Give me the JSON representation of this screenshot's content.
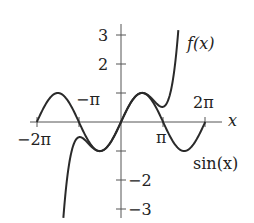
{
  "chart_data": {
    "type": "line",
    "title": "",
    "xlabel": "x",
    "ylabel": "",
    "xlim": [
      -6.7,
      7.6
    ],
    "ylim": [
      -3.4,
      3.5
    ],
    "grid": false,
    "legend": "inline labels",
    "x_ticks": [
      {
        "value": -6.2832,
        "label": "−2π"
      },
      {
        "value": -3.1416,
        "label": "−π"
      },
      {
        "value": 3.1416,
        "label": "π"
      },
      {
        "value": 6.2832,
        "label": "2π"
      }
    ],
    "y_ticks": [
      {
        "value": 3,
        "label": "3"
      },
      {
        "value": 2,
        "label": "2"
      },
      {
        "value": 1,
        "label": ""
      },
      {
        "value": -1,
        "label": ""
      },
      {
        "value": -2,
        "label": "−2"
      },
      {
        "value": -3,
        "label": "−3"
      }
    ],
    "series": [
      {
        "name": "f(x)",
        "label": "f(x)",
        "description": "Taylor polynomial x - x^3/6 + x^5/120",
        "x": [
          -4.4,
          -4.2,
          -4.0,
          -3.6,
          -3.2,
          -2.8,
          -2.4,
          -2.0,
          -1.6,
          -1.2,
          -0.8,
          -0.4,
          0.0,
          0.4,
          0.8,
          1.2,
          1.6,
          2.0,
          2.4,
          2.8,
          3.2,
          3.6,
          4.0,
          4.2,
          4.4
        ],
        "values": [
          -3.55,
          -2.74,
          -1.87,
          -0.71,
          -0.54,
          -0.7,
          -0.89,
          -0.93,
          -0.8,
          -0.93,
          -0.72,
          -0.39,
          0.0,
          0.39,
          0.72,
          0.93,
          1.0,
          0.93,
          0.89,
          0.7,
          0.54,
          0.71,
          1.87,
          2.74,
          3.55
        ]
      },
      {
        "name": "sin(x)",
        "label": "sin(x)",
        "x_range": [
          -6.2832,
          6.2832
        ],
        "values_at_key_points": {
          "-2π": 0,
          "-3π/2": 1,
          "-π": 0,
          "-π/2": -1,
          "0": 0,
          "π/2": 1,
          "π": 0,
          "3π/2": -1,
          "2π": 0
        }
      }
    ]
  },
  "labels": {
    "f_label": "f(x)",
    "sin_label": "sin(x)",
    "x_axis": "x",
    "y3": "3",
    "y2": "2",
    "ym2": "−2",
    "ym3": "−3",
    "neg2pi": "−2π",
    "negpi": "−π",
    "pi": "π",
    "twopi": "2π"
  }
}
